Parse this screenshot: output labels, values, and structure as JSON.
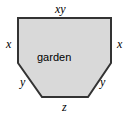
{
  "figure": {
    "interior_label": "garden",
    "shape": {
      "fill_color": "#d9d9d9",
      "stroke_color": "#333333",
      "stroke_width": 2,
      "background_color": "#ffffff",
      "vertices": [
        [
          18,
          18
        ],
        [
          111,
          18
        ],
        [
          111,
          63
        ],
        [
          88,
          97
        ],
        [
          42,
          97
        ],
        [
          18,
          63
        ]
      ],
      "sides": [
        {
          "name": "top",
          "label": "xy"
        },
        {
          "name": "right",
          "label": "x"
        },
        {
          "name": "lower-right-diagonal",
          "label": "y"
        },
        {
          "name": "bottom",
          "label": "z"
        },
        {
          "name": "lower-left-diagonal",
          "label": "y"
        },
        {
          "name": "left",
          "label": "x"
        }
      ]
    },
    "labels": {
      "top": "xy",
      "left": "x",
      "right": "x",
      "lower_left": "y",
      "lower_right": "y",
      "bottom": "z"
    }
  }
}
